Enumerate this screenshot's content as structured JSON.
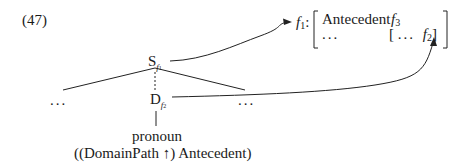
{
  "example_number": "(47)",
  "tree": {
    "root": {
      "label": "S",
      "fvar": "f",
      "fnum": "1"
    },
    "left_sibling": "...",
    "right_sibling": "...",
    "child": {
      "label": "D",
      "fvar": "f",
      "fnum": "2"
    },
    "leaf_word": "pronoun",
    "leaf_annotation": "((DomainPath ↑) Antecedent)"
  },
  "fstructure": {
    "label_var": "f",
    "label_num": "1",
    "label_colon": ":",
    "row1_attr": "Antecedent",
    "row1_val_var": "f",
    "row1_val_num": "3",
    "row2_attr": "...",
    "inner_open": "[",
    "inner_dots": "...",
    "inner_val_var": "f",
    "inner_val_num": "2",
    "inner_close": "]"
  }
}
